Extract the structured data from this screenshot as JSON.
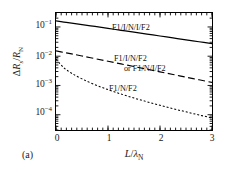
{
  "figure": {
    "panel_label": "(a)",
    "background": "#ffffff",
    "line_color": "#000000"
  },
  "chart_data": {
    "type": "line",
    "title": "",
    "subtitle": "",
    "xlabel": "L/λ_N",
    "ylabel": "ΔR_s/R_N",
    "xlim": [
      0,
      3
    ],
    "ylim": [
      3e-05,
      0.3
    ],
    "yscale": "log",
    "xscale": "linear",
    "grid": false,
    "legend": "inline-annotations",
    "xticks": [
      "0",
      "1",
      "2",
      "3"
    ],
    "xtick_values": [
      0,
      1,
      2,
      3
    ],
    "yticks": [
      "10⁻¹",
      "10⁻²",
      "10⁻³",
      "10⁻⁴"
    ],
    "ytick_values": [
      0.1,
      0.01,
      0.001,
      0.0001
    ],
    "x": [
      0,
      0.15,
      0.3,
      0.5,
      0.75,
      1.0,
      1.25,
      1.5,
      1.75,
      2.0,
      2.25,
      2.5,
      2.75,
      3.0
    ],
    "series": [
      {
        "name": "F1/I/N/I/F2",
        "style": "solid",
        "label": "F1/I/N/I/F2",
        "values": [
          0.16,
          0.147,
          0.135,
          0.121,
          0.104,
          0.0895,
          0.077,
          0.0662,
          0.057,
          0.049,
          0.0421,
          0.0362,
          0.0312,
          0.0268
        ]
      },
      {
        "name": "F1/I/N/F2",
        "style": "dashed",
        "label": "F1/I/N/F2",
        "label2": "or F1/N/I/F2",
        "values": [
          0.0152,
          0.0135,
          0.012,
          0.0102,
          0.00828,
          0.00672,
          0.00546,
          0.00443,
          0.00359,
          0.00292,
          0.00237,
          0.00192,
          0.00156,
          0.00127
        ]
      },
      {
        "name": "F1/N/F2",
        "style": "dotted",
        "label": "F1/N/F2",
        "values": [
          0.008,
          0.00405,
          0.00262,
          0.00168,
          0.00106,
          0.00072,
          0.00051,
          0.000372,
          0.000277,
          0.00021,
          0.000161,
          0.000125,
          9.8e-05,
          7.75e-05
        ]
      }
    ]
  },
  "axis": {
    "y_parts": {
      "delta": "Δ",
      "r": "R",
      "sub_s": "s",
      "slash": "/",
      "r2": "R",
      "sub_n": "N"
    },
    "x_parts": {
      "l": "L",
      "slash": "/",
      "lambda": "λ",
      "sub_n": "N"
    }
  },
  "annotations": {
    "top": "F1/I/N/I/F2",
    "mid_line1": "F1/I/N/F2",
    "mid_line2": "or F1/N/I/F2",
    "bottom": "F1/N/F2"
  }
}
